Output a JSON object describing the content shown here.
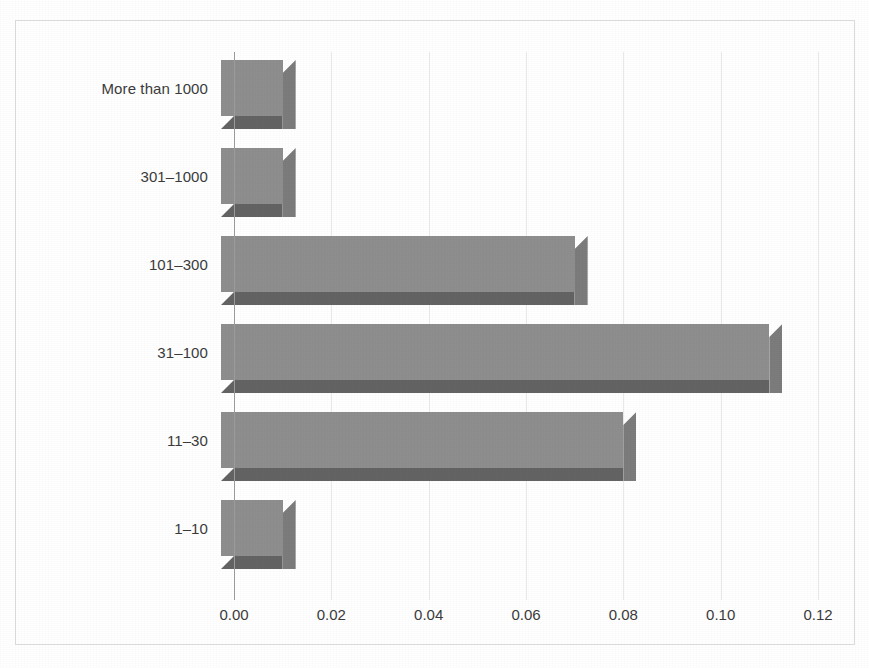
{
  "chart_data": {
    "type": "bar",
    "orientation": "horizontal",
    "title": "",
    "subtitle": "",
    "xlabel": "",
    "ylabel": "",
    "categories": [
      "More than 1000",
      "301–1000",
      "101–300",
      "31–100",
      "11–30",
      "1–10"
    ],
    "values": [
      0.01,
      0.01,
      0.07,
      0.11,
      0.08,
      0.01
    ],
    "series": [
      {
        "name": "",
        "values": [
          0.01,
          0.01,
          0.07,
          0.11,
          0.08,
          0.01
        ]
      }
    ],
    "xlim": [
      0.0,
      0.12
    ],
    "xticks": [
      0.0,
      0.02,
      0.04,
      0.06,
      0.08,
      0.1,
      0.12
    ],
    "xtick_labels": [
      "0.00",
      "0.02",
      "0.04",
      "0.06",
      "0.08",
      "0.10",
      "0.12"
    ],
    "grid": "vertical",
    "legend": "none",
    "style": "3d-bar",
    "bar_color": "#8e8e8e",
    "bar_shadow_color": "#636363",
    "bar_side_color": "#7c7c7c",
    "gridline_color": "#e9e9e9",
    "axis_color": "#9a9a9a",
    "text_color": "#3b3b3b",
    "frame_color": "#dcdcdc",
    "background_color": "#ffffff"
  }
}
